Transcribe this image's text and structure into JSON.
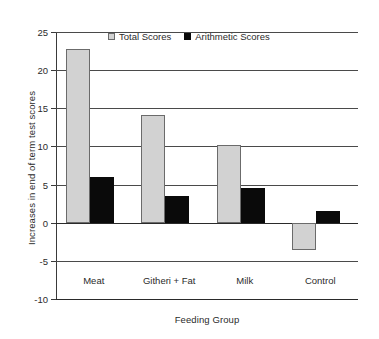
{
  "chart_data": {
    "type": "bar",
    "title": "",
    "xlabel": "Feeding Group",
    "ylabel": "Increases in end of term test scores",
    "categories": [
      "Meat",
      "Githeri + Fat",
      "Milk",
      "Control"
    ],
    "series": [
      {
        "name": "Total Scores",
        "color": "#d2d2d2",
        "values": [
          22.8,
          14.1,
          10.2,
          -3.6
        ]
      },
      {
        "name": "Arithmetic Scores",
        "color": "#0a0a0a",
        "values": [
          6.0,
          3.5,
          4.5,
          1.6
        ]
      }
    ],
    "ylim": [
      -10,
      25
    ],
    "yticks": [
      25,
      20,
      15,
      10,
      5,
      0,
      -5,
      -10
    ],
    "ytick_labels": [
      "25",
      "20",
      "15",
      "10",
      "5",
      "0",
      "-5",
      "-10"
    ],
    "grid": true,
    "legend_position": "top-center"
  },
  "legend": {
    "entries": [
      {
        "label": "Total Scores"
      },
      {
        "label": "Arithmetic Scores"
      }
    ]
  },
  "axes": {
    "x_title": "Feeding Group",
    "y_title": "Increases in end of term test scores"
  }
}
